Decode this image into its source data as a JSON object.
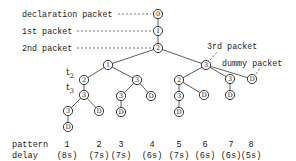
{
  "labels": {
    "declaration": "declaration packet",
    "first": "1st packet",
    "second": "2nd packet",
    "third": "3rd packet",
    "dummy": "dummy packet",
    "t2": "t",
    "t2_sub": "2",
    "t3": "t",
    "t3_sub": "3"
  },
  "tree": {
    "nodes": [
      {
        "id": "n0",
        "label": "0",
        "x": 158,
        "y": 14
      },
      {
        "id": "n1",
        "label": "1",
        "x": 158,
        "y": 31
      },
      {
        "id": "n2",
        "label": "2",
        "x": 158,
        "y": 48
      },
      {
        "id": "a1",
        "label": "1",
        "x": 108,
        "y": 65
      },
      {
        "id": "a3",
        "label": "3",
        "x": 206,
        "y": 65
      },
      {
        "id": "b2",
        "label": "2",
        "x": 84,
        "y": 80
      },
      {
        "id": "b3",
        "label": "3",
        "x": 84,
        "y": 95
      },
      {
        "id": "c3",
        "label": "3",
        "x": 68,
        "y": 111
      },
      {
        "id": "cD",
        "label": "D",
        "x": 68,
        "y": 127
      },
      {
        "id": "dD",
        "label": "D",
        "x": 99,
        "y": 111
      },
      {
        "id": "e3",
        "label": "3",
        "x": 137,
        "y": 80
      },
      {
        "id": "f3",
        "label": "3",
        "x": 121,
        "y": 96
      },
      {
        "id": "fD",
        "label": "D",
        "x": 121,
        "y": 112
      },
      {
        "id": "gD",
        "label": "D",
        "x": 151,
        "y": 96
      },
      {
        "id": "h2",
        "label": "2",
        "x": 179,
        "y": 80
      },
      {
        "id": "i3",
        "label": "3",
        "x": 179,
        "y": 96
      },
      {
        "id": "iD",
        "label": "D",
        "x": 179,
        "y": 112
      },
      {
        "id": "jD",
        "label": "D",
        "x": 204,
        "y": 95
      },
      {
        "id": "k3",
        "label": "3",
        "x": 230,
        "y": 79
      },
      {
        "id": "kD",
        "label": "D",
        "x": 230,
        "y": 95
      },
      {
        "id": "lD",
        "label": "D",
        "x": 252,
        "y": 79
      }
    ],
    "edges": [
      [
        "n0",
        "n1"
      ],
      [
        "n1",
        "n2"
      ],
      [
        "n2",
        "a1"
      ],
      [
        "n2",
        "a3"
      ],
      [
        "a1",
        "b2"
      ],
      [
        "b2",
        "b3"
      ],
      [
        "b3",
        "c3"
      ],
      [
        "c3",
        "cD"
      ],
      [
        "b3",
        "dD"
      ],
      [
        "a1",
        "e3"
      ],
      [
        "e3",
        "f3"
      ],
      [
        "f3",
        "fD"
      ],
      [
        "e3",
        "gD"
      ],
      [
        "a3",
        "h2"
      ],
      [
        "h2",
        "i3"
      ],
      [
        "i3",
        "iD"
      ],
      [
        "h2",
        "jD"
      ],
      [
        "a3",
        "k3"
      ],
      [
        "k3",
        "kD"
      ],
      [
        "a3",
        "lD"
      ]
    ]
  },
  "footer": {
    "pattern_label": "pattern",
    "delay_label": "delay",
    "patterns": [
      {
        "num": "1",
        "delay": "(8s)",
        "x": 67
      },
      {
        "num": "2",
        "delay": "(7s)",
        "x": 99
      },
      {
        "num": "3",
        "delay": "(7s)",
        "x": 121
      },
      {
        "num": "4",
        "delay": "(6s)",
        "x": 152
      },
      {
        "num": "5",
        "delay": "(7s)",
        "x": 179
      },
      {
        "num": "6",
        "delay": "(6s)",
        "x": 205
      },
      {
        "num": "7",
        "delay": "(6s)",
        "x": 231
      },
      {
        "num": "8",
        "delay": "(5s)",
        "x": 251
      }
    ]
  }
}
